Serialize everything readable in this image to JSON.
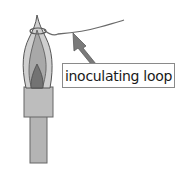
{
  "diagram": {
    "label": "inoculating loop",
    "colors": {
      "outline": "#555555",
      "flame_outer": "#c8c8c8",
      "flame_inner": "#9a9a9a",
      "flame_core": "#6e6e6e",
      "burner": "#b4b4b4",
      "wire": "#6a6a6a",
      "arrow_fill": "#7a7a7a",
      "label_border": "#8a8a8a"
    }
  }
}
